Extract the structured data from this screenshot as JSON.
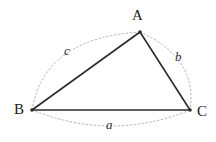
{
  "figure": {
    "name": "triangle-with-arc-side-labels",
    "background_color": "#ffffff",
    "width": 216,
    "height": 142,
    "stroke_color": "#2b2b2b",
    "arc_color": "#aaaaaa",
    "label_color": "#1a1a1a"
  },
  "vertices": {
    "A": {
      "label": "A",
      "x": 140,
      "y": 32,
      "label_x": 140,
      "label_y": 15
    },
    "B": {
      "label": "B",
      "x": 32,
      "y": 110,
      "label_x": 21,
      "label_y": 110
    },
    "C": {
      "label": "C",
      "x": 190,
      "y": 110,
      "label_x": 202,
      "label_y": 112
    }
  },
  "sides": {
    "a": {
      "label": "a",
      "from": "B",
      "to": "C",
      "label_x": 112,
      "label_y": 125
    },
    "b": {
      "label": "b",
      "from": "A",
      "to": "C",
      "label_x": 181,
      "label_y": 57
    },
    "c": {
      "label": "c",
      "from": "B",
      "to": "A",
      "label_x": 70,
      "label_y": 51
    }
  },
  "geometry": {
    "triangle_path": "M 32 110 L 140 32 L 190 110 Z",
    "arc_c_path": "M 32 110 Q 44 38 140 32",
    "arc_b_path": "M 140 32 Q 198 58 190 110",
    "arc_a_path": "M 32 110 Q 112 142 190 110",
    "triangle_stroke_width": 1.6,
    "arc_stroke_width": 0.9,
    "arc_dash": "1.6 2.4",
    "vertex_dot_radius": 1.8
  }
}
